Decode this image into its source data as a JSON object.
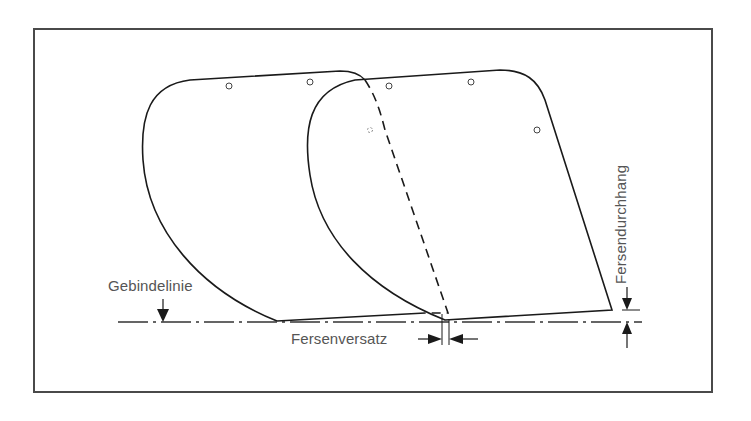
{
  "figure": {
    "type": "technical-diagram",
    "labels": {
      "gebindelinie": "Gebindelinie",
      "fersenversatz": "Fersenversatz",
      "fersendurchhang": "Fersendurchhang"
    },
    "colors": {
      "line": "#1a1a1a",
      "label": "#555555",
      "frame": "#4a4a4a",
      "background": "#ffffff"
    }
  }
}
